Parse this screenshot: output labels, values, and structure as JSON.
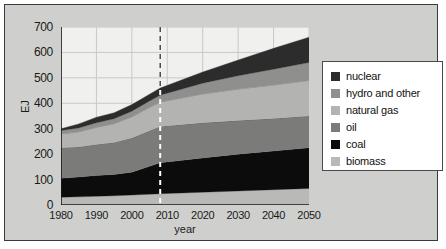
{
  "chart_data": {
    "type": "area",
    "title": "",
    "subtitle": "",
    "xlabel": "year",
    "ylabel": "EJ",
    "xlim": [
      1980,
      2050
    ],
    "ylim": [
      0,
      700
    ],
    "xticks": [
      1980,
      1990,
      2000,
      2010,
      2020,
      2030,
      2040,
      2050
    ],
    "yticks": [
      0,
      100,
      200,
      300,
      400,
      500,
      600,
      700
    ],
    "grid": true,
    "legend_position": "right",
    "stacked": true,
    "stack_order_bottom_to_top": [
      "biomass",
      "coal",
      "oil",
      "natural gas",
      "hydro and other",
      "nuclear"
    ],
    "annotations": [
      {
        "type": "vertical-dashed-line",
        "x": 2008,
        "label": "history / projection divide"
      }
    ],
    "x": [
      1980,
      1985,
      1990,
      1995,
      2000,
      2005,
      2008,
      2020,
      2030,
      2040,
      2050
    ],
    "series": [
      {
        "name": "biomass",
        "color": "#b9b9b7",
        "values": [
          30,
          32,
          34,
          36,
          39,
          42,
          44,
          50,
          55,
          60,
          65
        ]
      },
      {
        "name": "coal",
        "color": "#0c0c0c",
        "values": [
          75,
          78,
          82,
          84,
          90,
          110,
          122,
          135,
          145,
          152,
          160
        ]
      },
      {
        "name": "oil",
        "color": "#7b7b79",
        "values": [
          120,
          118,
          122,
          126,
          134,
          140,
          143,
          138,
          132,
          128,
          125
        ]
      },
      {
        "name": "natural gas",
        "color": "#b3b3b1",
        "values": [
          55,
          60,
          68,
          74,
          84,
          92,
          96,
          114,
          124,
          132,
          140
        ]
      },
      {
        "name": "hydro and other",
        "color": "#8f8f8d",
        "values": [
          13,
          15,
          17,
          19,
          22,
          25,
          27,
          42,
          52,
          62,
          70
        ]
      },
      {
        "name": "nuclear",
        "color": "#2c2c2c",
        "values": [
          7,
          16,
          22,
          24,
          26,
          27,
          28,
          44,
          62,
          82,
          100
        ]
      }
    ],
    "totals": [
      300,
      319,
      345,
      363,
      395,
      436,
      460,
      523,
      570,
      616,
      660
    ]
  },
  "axis": {
    "y_ticks": [
      {
        "label": "700",
        "value": 700
      },
      {
        "label": "600",
        "value": 600
      },
      {
        "label": "500",
        "value": 500
      },
      {
        "label": "400",
        "value": 400
      },
      {
        "label": "300",
        "value": 300
      },
      {
        "label": "200",
        "value": 200
      },
      {
        "label": "100",
        "value": 100
      },
      {
        "label": "0",
        "value": 0
      }
    ],
    "x_ticks": [
      {
        "label": "1980",
        "value": 1980
      },
      {
        "label": "1990",
        "value": 1990
      },
      {
        "label": "2000",
        "value": 2000
      },
      {
        "label": "2010",
        "value": 2010
      },
      {
        "label": "2020",
        "value": 2020
      },
      {
        "label": "2030",
        "value": 2030
      },
      {
        "label": "2040",
        "value": 2040
      },
      {
        "label": "2050",
        "value": 2050
      }
    ],
    "y_title": "EJ",
    "x_title": "year"
  },
  "legend": {
    "items": [
      {
        "label": "nuclear",
        "color": "#2c2c2c"
      },
      {
        "label": "hydro and other",
        "color": "#8f8f8d"
      },
      {
        "label": "natural gas",
        "color": "#b3b3b1"
      },
      {
        "label": "oil",
        "color": "#7b7b79"
      },
      {
        "label": "coal",
        "color": "#0c0c0c"
      },
      {
        "label": "biomass",
        "color": "#b9b9b7"
      }
    ]
  },
  "theme": {
    "page_background": "#cfd0cd",
    "plot_background": "#f0f0ee",
    "frame_border": "#3a3a3a",
    "grid_color": "#c8c8c6",
    "axis_color": "#1a1a1a",
    "divider_color": "#ffffff"
  }
}
